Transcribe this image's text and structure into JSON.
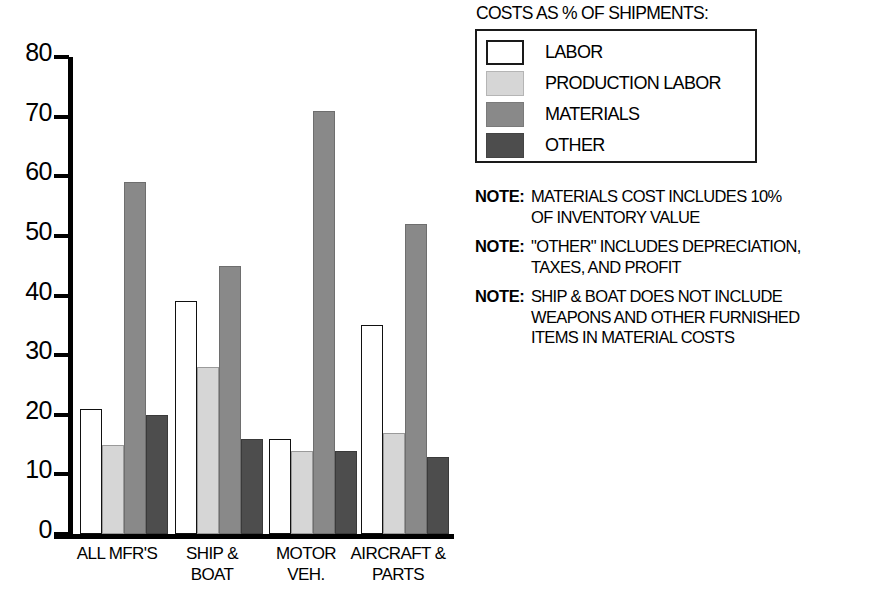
{
  "chart_data": {
    "type": "bar",
    "title": "COSTS AS % OF SHIPMENTS:",
    "xlabel": "",
    "ylabel": "",
    "ylim": [
      0,
      80
    ],
    "yticks": [
      0,
      10,
      20,
      30,
      40,
      50,
      60,
      70,
      80
    ],
    "grid": false,
    "legend_position": "top-right",
    "categories": [
      "ALL MFR'S",
      "SHIP & BOAT",
      "MOTOR VEH.",
      "AIRCRAFT & PARTS"
    ],
    "category_lines": [
      [
        "ALL MFR'S"
      ],
      [
        "SHIP &",
        "BOAT"
      ],
      [
        "MOTOR",
        "VEH."
      ],
      [
        "AIRCRAFT &",
        "PARTS"
      ]
    ],
    "series": [
      {
        "name": "LABOR",
        "color": "#ffffff",
        "values": [
          21,
          39,
          16,
          35
        ]
      },
      {
        "name": "PRODUCTION LABOR",
        "color": "#d6d6d6",
        "values": [
          15,
          28,
          14,
          17
        ]
      },
      {
        "name": "MATERIALS",
        "color": "#898989",
        "values": [
          59,
          45,
          71,
          52
        ]
      },
      {
        "name": "OTHER",
        "color": "#4d4d4d",
        "values": [
          20,
          16,
          14,
          13
        ]
      }
    ]
  },
  "legend": {
    "title": "COSTS AS % OF SHIPMENTS:",
    "items": [
      {
        "label": "LABOR",
        "swatch": "labor"
      },
      {
        "label": "PRODUCTION LABOR",
        "swatch": "prodlabor"
      },
      {
        "label": "MATERIALS",
        "swatch": "materials"
      },
      {
        "label": "OTHER",
        "swatch": "other"
      }
    ]
  },
  "notes": [
    {
      "tag": "NOTE:",
      "lines": [
        "MATERIALS COST INCLUDES 10%",
        "OF INVENTORY VALUE"
      ]
    },
    {
      "tag": "NOTE:",
      "lines": [
        "\"OTHER\" INCLUDES DEPRECIATION,",
        "TAXES, AND PROFIT"
      ]
    },
    {
      "tag": "NOTE:",
      "lines": [
        "SHIP & BOAT DOES NOT INCLUDE",
        "WEAPONS AND OTHER FURNISHED",
        "ITEMS IN MATERIAL COSTS"
      ]
    }
  ]
}
